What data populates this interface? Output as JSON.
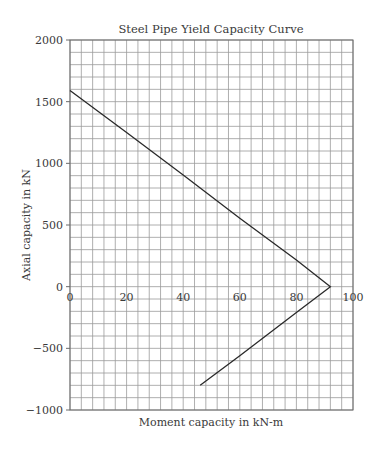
{
  "chart_data": {
    "type": "line",
    "title": "Steel Pipe Yield Capacity Curve",
    "xlabel": "Moment capacity in kN-m",
    "ylabel": "Axial capacity in kN",
    "xlim": [
      0,
      100
    ],
    "ylim": [
      -1000,
      2000
    ],
    "x_ticks": [
      0,
      20,
      40,
      60,
      80,
      100
    ],
    "x_tick_labels": [
      "0",
      "20",
      "40",
      "60",
      "80",
      "100"
    ],
    "y_ticks": [
      2000,
      1500,
      1000,
      500,
      0,
      -500,
      -1000
    ],
    "y_tick_labels": [
      "2000",
      "1500",
      "1000",
      "500",
      "0",
      "−500",
      "−1000"
    ],
    "grid": true,
    "grid_x_step": 4,
    "grid_y_step": 100,
    "legend": null,
    "series": [
      {
        "name": "Yield capacity",
        "x": [
          0,
          20,
          40,
          60,
          80,
          92,
          80,
          60,
          46
        ],
        "y": [
          1590,
          1250,
          905,
          555,
          215,
          0,
          -210,
          -560,
          -800
        ]
      }
    ]
  }
}
